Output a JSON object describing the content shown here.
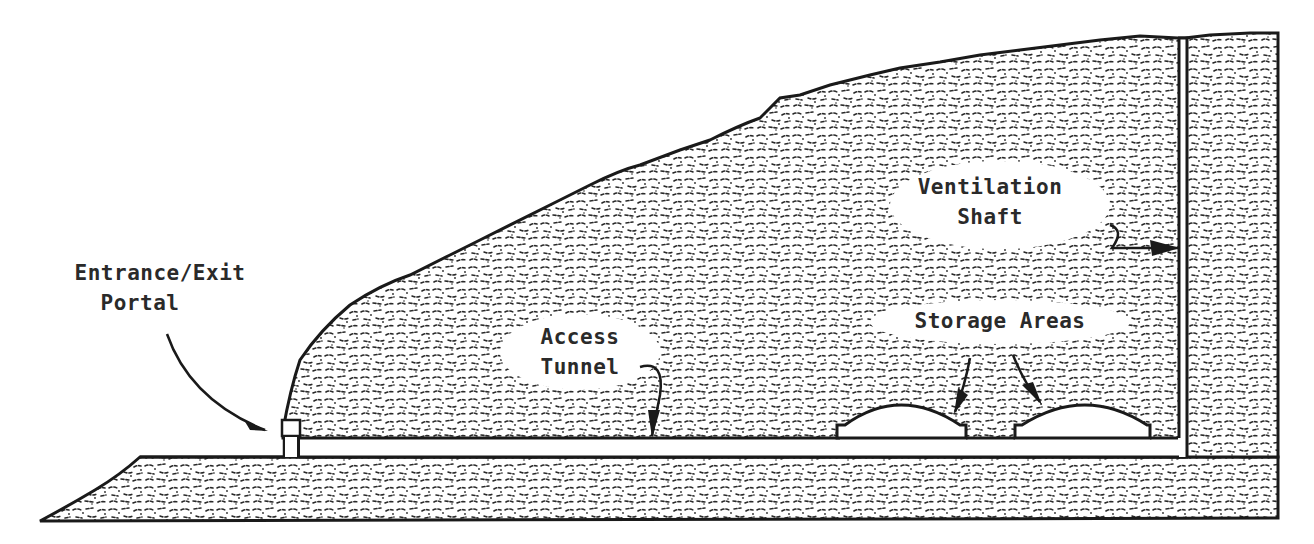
{
  "diagram": {
    "type": "cross-section",
    "colors": {
      "ink": "#1a1a1a",
      "rock_texture": "#2a2a2a",
      "background": "#ffffff"
    },
    "labels": {
      "entrance": {
        "line1": "Entrance/Exit",
        "line2": "Portal"
      },
      "access_tunnel": {
        "line1": "Access",
        "line2": "Tunnel"
      },
      "ventilation_shaft": {
        "line1": "Ventilation",
        "line2": "Shaft"
      },
      "storage_areas": {
        "line1": "Storage Areas"
      }
    },
    "components": [
      "entrance-exit-portal",
      "access-tunnel",
      "storage-area-1",
      "storage-area-2",
      "ventilation-shaft",
      "mountain-rock-mass",
      "base-ground-layer"
    ]
  }
}
